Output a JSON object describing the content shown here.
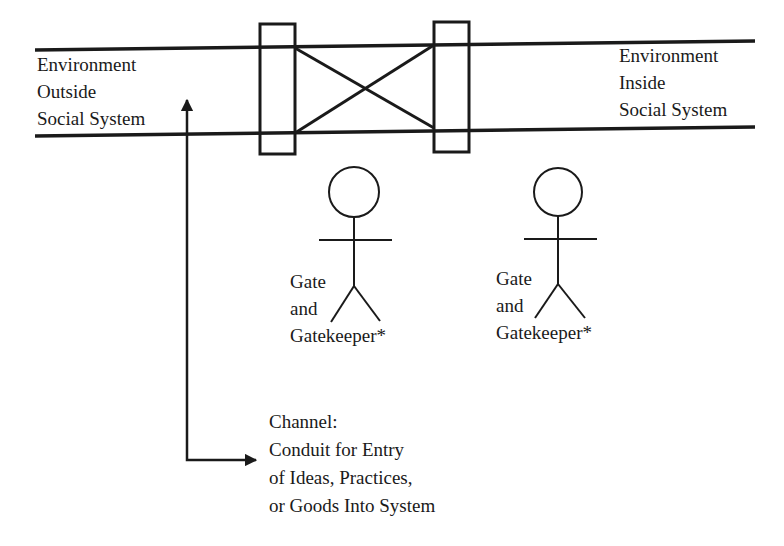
{
  "diagram": {
    "type": "gatekeeper-channel-model",
    "colors": {
      "ink": "#1a1a1a",
      "background": "#ffffff"
    },
    "environment_outside": {
      "lines": [
        "Environment",
        "Outside",
        "Social System"
      ]
    },
    "environment_inside": {
      "lines": [
        "Environment",
        "Inside",
        "Social System"
      ]
    },
    "gates": [
      {
        "id": "left-gate",
        "shape": "rectangle"
      },
      {
        "id": "right-gate",
        "shape": "rectangle"
      }
    ],
    "gatekeepers": [
      {
        "id": "gatekeeper-1",
        "lines": [
          "Gate",
          "and",
          "Gatekeeper*"
        ],
        "icon": "stick-figure-icon"
      },
      {
        "id": "gatekeeper-2",
        "lines": [
          "Gate",
          "and",
          "Gatekeeper*"
        ],
        "icon": "stick-figure-icon"
      }
    ],
    "channel": {
      "lines": [
        "Channel:",
        "Conduit for Entry",
        "of Ideas, Practices,",
        "or Goods Into System"
      ],
      "icon": "elbow-arrow-icon"
    }
  }
}
